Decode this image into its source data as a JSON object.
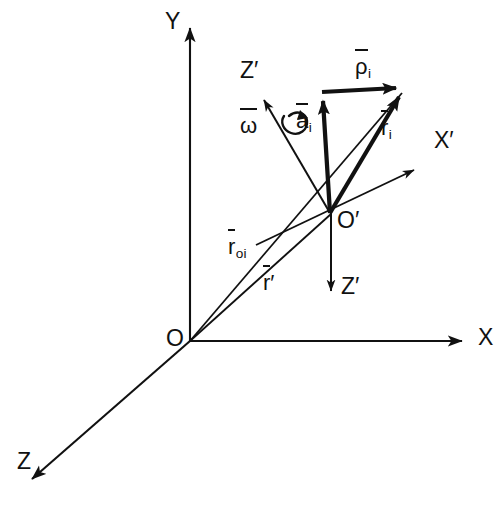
{
  "figure": {
    "background_color": "#ffffff",
    "stroke_color": "#111111",
    "width": 500,
    "height": 505
  },
  "axes": {
    "global": [
      {
        "name": "Y",
        "label": "Y",
        "direction": "up",
        "origin_label": "O"
      },
      {
        "name": "X",
        "label": "X",
        "direction": "right",
        "origin_label": "O"
      },
      {
        "name": "Z",
        "label": "Z",
        "direction": "down-left",
        "origin_label": "O"
      }
    ],
    "local": [
      {
        "name": "X-prime",
        "label": "X′",
        "direction": "up-right",
        "origin_label": "O′"
      },
      {
        "name": "Z-prime-up",
        "label": "Z′",
        "direction": "up-left",
        "origin_label": "O′"
      },
      {
        "name": "Z-prime-down",
        "label": "Z′",
        "direction": "down",
        "origin_label": "O′"
      }
    ]
  },
  "origins": {
    "global": "O",
    "local": "O′"
  },
  "vectors": [
    {
      "id": "rho-i",
      "label_base": "ρ",
      "label_sub": "i",
      "label_plain": "ρ̄ᵢ",
      "overbar": true,
      "weight": "thick",
      "from": "tip-of-a-i",
      "to": "particle-i"
    },
    {
      "id": "a-i",
      "label_base": "a",
      "label_sub": "i",
      "label_plain": "āᵢ",
      "overbar": true,
      "weight": "thick",
      "from": "O′",
      "to": "intermediate-point"
    },
    {
      "id": "r-i",
      "label_base": "r",
      "label_sub": "i",
      "label_plain": "r̄ᵢ",
      "overbar": true,
      "weight": "thick",
      "from": "O′",
      "to": "particle-i"
    },
    {
      "id": "r-oi",
      "label_base": "r",
      "label_sub": "oi",
      "label_plain": "r̄ₒᵢ",
      "overbar": true,
      "weight": "thin",
      "from": "O",
      "to": "particle-i"
    },
    {
      "id": "r-prime",
      "label_base": "r",
      "label_sub": "",
      "label_prime": "′",
      "label_plain": "r̄′",
      "overbar": true,
      "weight": "thin",
      "from": "O",
      "to": "O′"
    },
    {
      "id": "omega",
      "label_base": "ω",
      "label_sub": "",
      "label_plain": "ω̄",
      "overbar": true,
      "weight": "thin",
      "note": "angular-velocity about Z-prime axis"
    }
  ],
  "annotations": {
    "rotation_symbol": "curved-rotation-arrow-about-z-prime"
  }
}
